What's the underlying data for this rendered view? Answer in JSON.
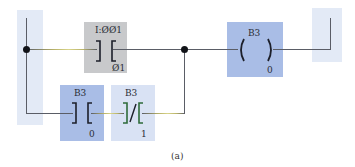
{
  "diagram": {
    "type": "ladder-logic-rung",
    "caption": "(a)",
    "colors": {
      "rail_band": "#e3eaf6",
      "input_box": "#c8c9cb",
      "seal_box": "#a9bde6",
      "nc_box": "#d9e2f4",
      "coil_box": "#a9bde6",
      "wire": "#5a5d66",
      "nc_contact": "#2e6b3a"
    },
    "elements": {
      "input_contact": {
        "kind": "XIC",
        "address": "I:ØØ1",
        "bit": "Ø1"
      },
      "output_coil": {
        "kind": "OTE",
        "address": "B3",
        "bit": "0"
      },
      "seal_contact": {
        "kind": "XIC",
        "address": "B3",
        "bit": "0"
      },
      "nc_contact": {
        "kind": "XIO",
        "address": "B3",
        "bit": "1"
      }
    }
  }
}
